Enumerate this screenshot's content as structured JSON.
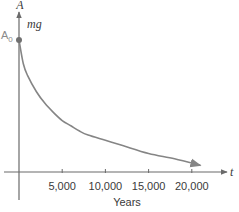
{
  "chart_data": {
    "type": "line",
    "title": "",
    "xlabel": "Years",
    "ylabel": "A",
    "x_axis_variable": "t",
    "y_axis_variable": "A",
    "unit_label": "mg",
    "initial_value_label": "A0",
    "initial_value_label_base": "A",
    "initial_value_label_sub": "0",
    "xlim": [
      0,
      25000
    ],
    "ylim": [
      0,
      1.2
    ],
    "x_ticks": [
      5000,
      10000,
      15000,
      20000
    ],
    "x_tick_labels": [
      "5,000",
      "10,000",
      "15,000",
      "20,000"
    ],
    "grid": false,
    "legend": "none",
    "series": [
      {
        "name": "A(t)",
        "color": "#858585",
        "x": [
          0,
          500,
          1000,
          2000,
          3000,
          4000,
          5000,
          6000,
          7000,
          8000,
          10000,
          12000,
          15000,
          18000,
          21000
        ],
        "y": [
          1.0,
          0.82,
          0.73,
          0.61,
          0.52,
          0.45,
          0.39,
          0.35,
          0.31,
          0.28,
          0.24,
          0.2,
          0.14,
          0.1,
          0.05
        ],
        "end_arrow": true
      }
    ],
    "initial_point": {
      "x": 0,
      "y": 1.0,
      "color": "#707070"
    },
    "axis_color": "#6a6a6a"
  }
}
